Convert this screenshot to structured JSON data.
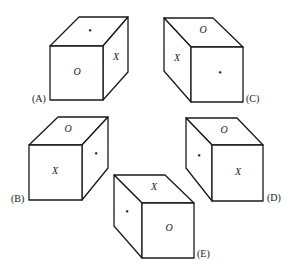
{
  "figure": {
    "type": "cube-folding-options",
    "cubes": [
      {
        "id": "A",
        "label": "(A)",
        "faces": {
          "front": "O",
          "top": "•",
          "side": "X"
        },
        "side_position": "right"
      },
      {
        "id": "B",
        "label": "(B)",
        "faces": {
          "front": "X",
          "top": "O",
          "side": "•"
        },
        "side_position": "right"
      },
      {
        "id": "C",
        "label": "(C)",
        "faces": {
          "front": "•",
          "top": "O",
          "side": "X"
        },
        "side_position": "left"
      },
      {
        "id": "D",
        "label": "(D)",
        "faces": {
          "front": "X",
          "top": "O",
          "side": "•"
        },
        "side_position": "left"
      },
      {
        "id": "E",
        "label": "(E)",
        "faces": {
          "front": "O",
          "top": "X",
          "side": "•"
        },
        "side_position": "left"
      }
    ]
  },
  "colors": {
    "stroke": "#1a1a1a",
    "background": "#ffffff"
  }
}
